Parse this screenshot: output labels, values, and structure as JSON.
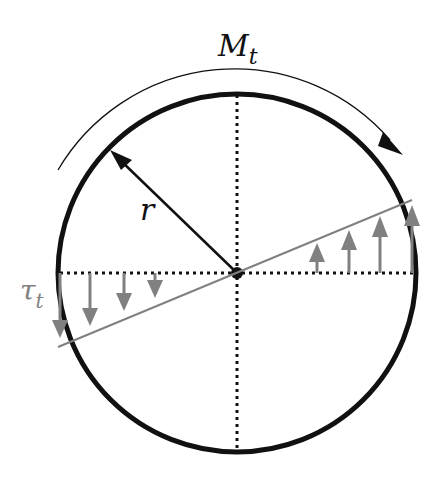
{
  "diagram": {
    "labels": {
      "moment": "M",
      "moment_sub": "t",
      "radius": "r",
      "stress": "τ",
      "stress_sub": "t"
    },
    "colors": {
      "outline": "#111111",
      "stress": "#808080",
      "axes": "#111111",
      "background": "#ffffff"
    },
    "geometry": {
      "center": [
        237,
        273
      ],
      "radius": 179
    }
  }
}
